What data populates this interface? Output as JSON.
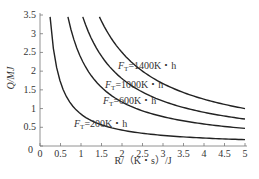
{
  "chart_data": {
    "type": "line",
    "title": "",
    "xlabel": "R/（K・s）/J",
    "ylabel": "Q/MJ",
    "xlim": [
      0,
      5
    ],
    "ylim": [
      0,
      3.5
    ],
    "grid": false,
    "x_ticks": [
      "0",
      "0.5",
      "1",
      "1.5",
      "2",
      "2.5",
      "3",
      "3.5",
      "4",
      "4.5",
      "5"
    ],
    "y_ticks": [
      "0",
      "0.5",
      "1",
      "1.5",
      "2",
      "2.5",
      "3",
      "3.5"
    ],
    "legend_position": "inline labels",
    "series": [
      {
        "name": "F_T=200K・h",
        "label_main": "F",
        "label_sub": "T",
        "label_rest": "=200K・h",
        "k": 0.85,
        "x": [
          0.25,
          0.5,
          1.0,
          1.5,
          2.0,
          3.0,
          4.0,
          5.0
        ],
        "y": [
          3.4,
          1.7,
          0.85,
          0.57,
          0.43,
          0.28,
          0.21,
          0.17
        ]
      },
      {
        "name": "F_T=600K・h",
        "label_main": "F",
        "label_sub": "T",
        "label_rest": "=600K・h",
        "k": 2.35,
        "x": [
          0.68,
          1.0,
          1.5,
          2.0,
          3.0,
          4.0,
          5.0
        ],
        "y": [
          3.45,
          2.35,
          1.57,
          1.18,
          0.78,
          0.59,
          0.47
        ]
      },
      {
        "name": "F_T=1000K・h",
        "label_main": "F",
        "label_sub": "T",
        "label_rest": "=1000K・h",
        "k": 3.6,
        "x": [
          1.04,
          1.5,
          2.0,
          3.0,
          4.0,
          5.0
        ],
        "y": [
          3.45,
          2.4,
          1.8,
          1.2,
          0.9,
          0.72
        ]
      },
      {
        "name": "F_T=1400K・h",
        "label_main": "F",
        "label_sub": "T",
        "label_rest": "=1400K・h",
        "k": 5.0,
        "x": [
          1.45,
          2.0,
          3.0,
          4.0,
          5.0
        ],
        "y": [
          3.45,
          2.5,
          1.67,
          1.25,
          1.0
        ]
      }
    ]
  }
}
